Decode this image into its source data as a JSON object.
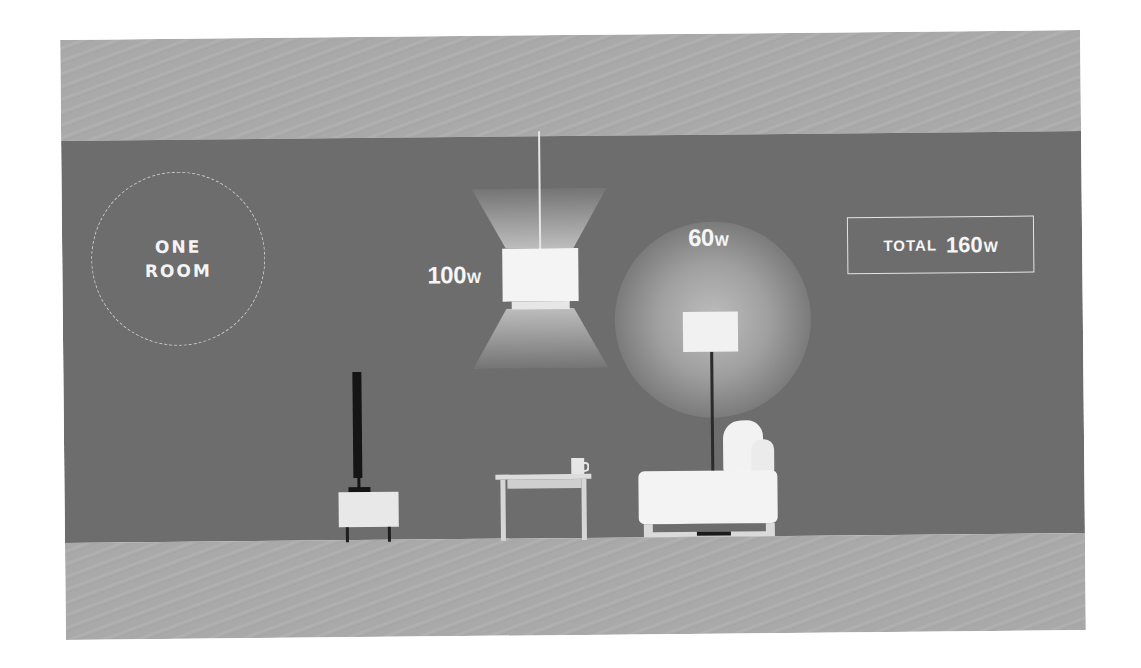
{
  "scene": {
    "colors": {
      "wall": "#6d6d6d",
      "ceiling_floor": "#a9a9a9",
      "text": "#f6f6f6",
      "fixture_white": "#f3f3f3",
      "tv_black": "#151515"
    }
  },
  "room_badge": {
    "line1": "ONE",
    "line2": "ROOM"
  },
  "pendant_lamp": {
    "watt_value": "100",
    "watt_unit": "W"
  },
  "floor_lamp": {
    "watt_value": "60",
    "watt_unit": "W"
  },
  "total": {
    "label": "TOTAL",
    "value": "160",
    "unit": "W"
  },
  "furniture": [
    "tv",
    "tv-cabinet",
    "side-table",
    "mug",
    "sofa",
    "floor-lamp",
    "pendant-lamp"
  ]
}
